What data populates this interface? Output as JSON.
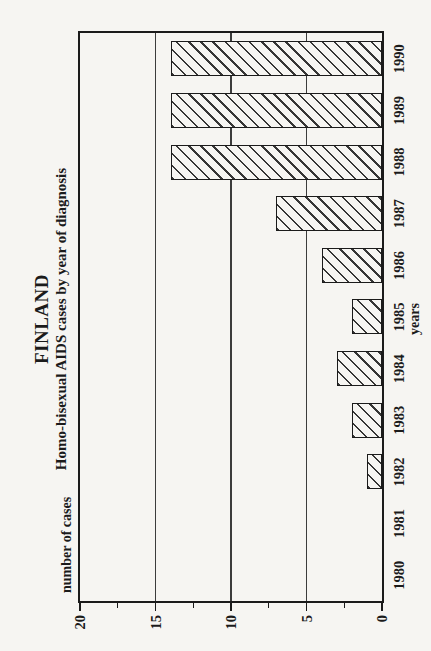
{
  "page": {
    "background": "#f6f5f2",
    "ink": "#1b1b1b",
    "rotation_note": "landscape chart printed rotated 90 degrees counterclockwise on a portrait page; all text reads bottom-to-top"
  },
  "chart_data": {
    "type": "bar",
    "title": "FINLAND",
    "subtitle": "Homo-bisexual AIDS cases by year of diagnosis",
    "xlabel": "years",
    "ylabel": "number of cases",
    "categories": [
      "1980",
      "1981",
      "1982",
      "1983",
      "1984",
      "1985",
      "1986",
      "1987",
      "1988",
      "1989",
      "1990"
    ],
    "values": [
      0,
      0,
      1,
      2,
      3,
      2,
      4,
      7,
      14,
      14,
      14
    ],
    "ylim": [
      0,
      20
    ],
    "yticks": [
      0,
      5,
      10,
      15,
      20
    ],
    "minor_yticks": [
      2.5,
      7.5,
      12.5,
      17.5
    ],
    "gridlines": [
      5,
      10,
      15
    ],
    "grid": "major horizontal gridlines only",
    "legend": "none",
    "bar_style": "diagonal-hatch, black outline on paper background",
    "bar_fill_hatch_direction_on_page": "top-left to bottom-right"
  }
}
